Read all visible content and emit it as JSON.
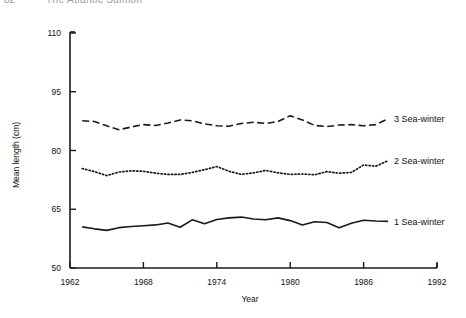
{
  "running_head": {
    "folio": "82",
    "title": "The Atlantic Salmon"
  },
  "chart_data": {
    "type": "line",
    "title": "",
    "xlabel": "Year",
    "ylabel": "Mean length (cm)",
    "xlim": [
      1962,
      1992
    ],
    "ylim": [
      50,
      110
    ],
    "xticks": [
      1962,
      1968,
      1974,
      1980,
      1986,
      1992
    ],
    "xtick_labels": [
      "1962",
      "1968",
      "1974",
      "1980",
      "1986",
      "1992"
    ],
    "yticks": [
      50,
      65,
      80,
      95,
      110
    ],
    "ytick_labels": [
      "50",
      "65",
      "80",
      "95",
      "110"
    ],
    "grid": false,
    "legend_position": "right-inline",
    "x": [
      1963,
      1964,
      1965,
      1966,
      1967,
      1968,
      1969,
      1970,
      1971,
      1972,
      1973,
      1974,
      1975,
      1976,
      1977,
      1978,
      1979,
      1980,
      1981,
      1982,
      1983,
      1984,
      1985,
      1986,
      1987,
      1988
    ],
    "series": [
      {
        "name": "3 Sea-winter",
        "label": "3 Sea-winter",
        "dash": "dashed",
        "color": "#1a1a1a",
        "values": [
          87.6,
          87.4,
          86.3,
          85.3,
          86.0,
          86.6,
          86.4,
          87.0,
          87.8,
          87.6,
          86.8,
          86.3,
          86.2,
          86.9,
          87.2,
          86.9,
          87.4,
          88.9,
          87.8,
          86.4,
          86.1,
          86.5,
          86.6,
          86.3,
          86.6,
          88.1
        ]
      },
      {
        "name": "2 Sea-winter",
        "label": "2 Sea-winter",
        "dash": "dotted",
        "color": "#1a1a1a",
        "values": [
          75.4,
          74.6,
          73.6,
          74.5,
          74.8,
          74.7,
          74.2,
          73.9,
          73.9,
          74.4,
          75.1,
          75.9,
          74.7,
          73.9,
          74.3,
          74.9,
          74.3,
          73.9,
          74.0,
          73.8,
          74.6,
          74.2,
          74.4,
          76.3,
          76.0,
          77.4
        ]
      },
      {
        "name": "1 Sea-winter",
        "label": "1 Sea-winter",
        "dash": "solid",
        "color": "#1a1a1a",
        "values": [
          60.5,
          60.0,
          59.6,
          60.3,
          60.6,
          60.8,
          61.0,
          61.5,
          60.4,
          62.3,
          61.3,
          62.4,
          62.8,
          63.0,
          62.5,
          62.3,
          62.8,
          62.1,
          61.0,
          61.8,
          61.6,
          60.3,
          61.4,
          62.2,
          62.0,
          61.9
        ]
      }
    ]
  }
}
